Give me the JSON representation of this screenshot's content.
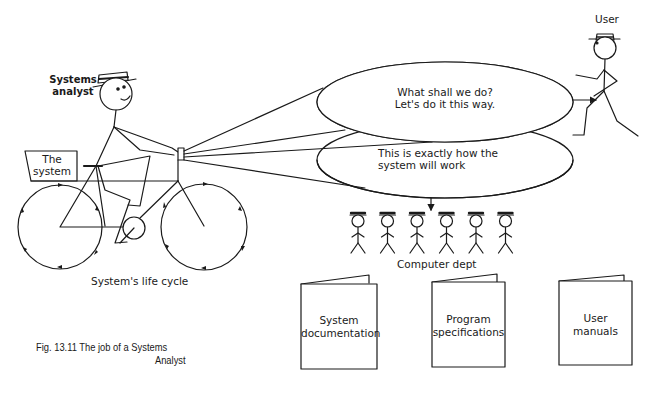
{
  "figure": {
    "caption_line1": "Fig. 13.11 The job of a Systems",
    "caption_line2": "Analyst"
  },
  "labels": {
    "systems_analyst_line1": "Systems",
    "systems_analyst_line2": "analyst",
    "the_system_line1": "The",
    "the_system_line2": "system",
    "life_cycle": "System's life cycle",
    "user": "User",
    "computer_dept": "Computer dept"
  },
  "bubbles": [
    {
      "id": "top",
      "line1": "What shall we do?",
      "line2": "Let's do it this way."
    },
    {
      "id": "bottom",
      "line1": "This is exactly how the",
      "line2": "system will work"
    }
  ],
  "documents": [
    {
      "line1": "System",
      "line2": "documentation"
    },
    {
      "line1": "Program",
      "line2": "specifications"
    },
    {
      "line1": "User",
      "line2": "manuals"
    }
  ],
  "computer_dept_people_count": 6,
  "colors": {
    "ink": "#1a1a1a",
    "background": "#ffffff"
  }
}
